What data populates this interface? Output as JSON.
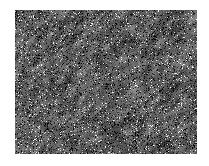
{
  "figure": {
    "canvas": {
      "width": 209,
      "height": 166
    },
    "background_color": "#ffffff"
  },
  "texture_panel": {
    "name": "speckle-texture",
    "x": 15,
    "y": 10,
    "width": 182,
    "height": 144,
    "border": "none",
    "border_color": "#ffffff"
  },
  "chart_data": {
    "type": "heatmap",
    "xlabel": "",
    "ylabel": "",
    "grid": false,
    "legend": "none",
    "colormap": "gray",
    "value_range": [
      0,
      255
    ],
    "mean_intensity": 96,
    "std_intensity": 58,
    "grain": {
      "cell_size_px": 2.0,
      "streak_angle_deg": 135,
      "streak_length_px": 7,
      "anisotropy": 0.78,
      "contrast": 1.35,
      "bright_speckle_density": 0.055,
      "dark_speckle_density": 0.14
    },
    "seed": 20250413,
    "x": [
      0,
      182
    ],
    "y": [
      0,
      144
    ]
  }
}
